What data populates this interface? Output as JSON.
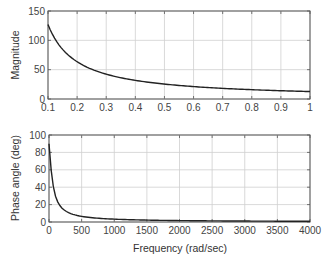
{
  "chart_data": [
    {
      "type": "line",
      "title": "",
      "xlabel": "",
      "ylabel": "Magnitude",
      "xlim": [
        0.1,
        1
      ],
      "ylim": [
        0,
        150
      ],
      "xticks": [
        "0.1",
        "0.2",
        "0.3",
        "0.4",
        "0.5",
        "0.6",
        "0.7",
        "0.8",
        "0.9",
        "1"
      ],
      "yticks": [
        "0",
        "50",
        "100",
        "150"
      ],
      "grid": true,
      "series": [
        {
          "name": "Magnitude",
          "x": [
            0.1,
            0.15,
            0.2,
            0.25,
            0.3,
            0.4,
            0.5,
            0.6,
            0.7,
            0.8,
            0.9,
            1.0
          ],
          "values": [
            127,
            85,
            63,
            51,
            42,
            32,
            25,
            21,
            18,
            16,
            14,
            13
          ]
        }
      ]
    },
    {
      "type": "line",
      "title": "",
      "xlabel": "Frequency (rad/sec)",
      "ylabel": "Phase angle (deg)",
      "xlim": [
        0,
        4000
      ],
      "ylim": [
        0,
        100
      ],
      "xticks": [
        "0",
        "500",
        "1000",
        "1500",
        "2000",
        "2500",
        "3000",
        "3500",
        "4000"
      ],
      "yticks": [
        "0",
        "20",
        "40",
        "60",
        "80",
        "100"
      ],
      "grid": true,
      "series": [
        {
          "name": "Phase angle",
          "x": [
            0,
            100,
            200,
            300,
            400,
            500,
            750,
            1000,
            1500,
            2000,
            2500,
            3000,
            3500,
            4000
          ],
          "values": [
            90,
            72,
            55,
            43,
            34,
            28,
            20,
            15,
            10,
            8,
            6.5,
            5.5,
            4.5,
            4
          ]
        }
      ]
    }
  ],
  "labels": {
    "top_ylabel": "Magnitude",
    "bottom_ylabel": "Phase angle (deg)",
    "bottom_xlabel": "Frequency (rad/sec)"
  }
}
